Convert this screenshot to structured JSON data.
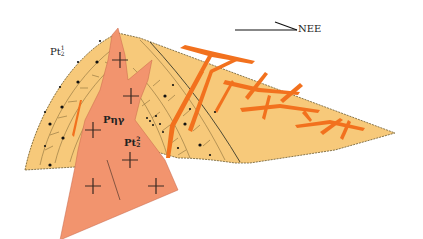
{
  "diagram": {
    "type": "geological block diagram",
    "direction_arrow": {
      "label": "NEE"
    },
    "labels": {
      "pl_upper": {
        "base": "Pt",
        "sub": "2",
        "sup": "1"
      },
      "pl_lower": {
        "base": "Pt",
        "sub": "2",
        "sup": "2"
      },
      "granite": "Pηγ"
    },
    "colors": {
      "strata_fill": "#f7c97a",
      "granite_fill": "#f2946e",
      "vein_color": "#f2711e",
      "line_color": "#5a4a2a"
    }
  }
}
